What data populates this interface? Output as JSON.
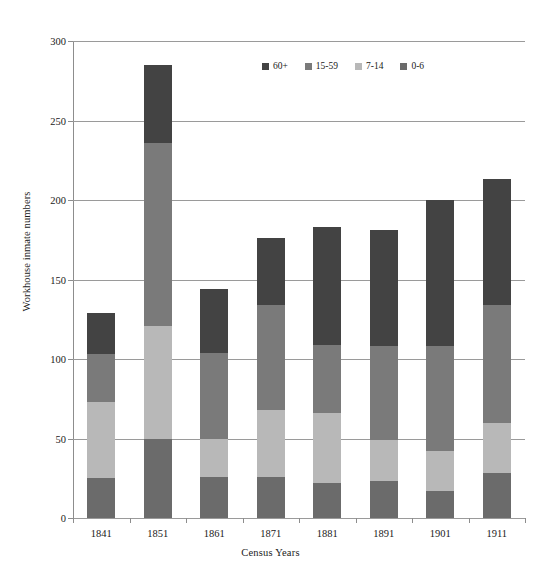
{
  "chart_data": {
    "type": "bar",
    "stacked": true,
    "title": "",
    "xlabel": "Census Years",
    "ylabel": "Workhouse inmate numbers",
    "categories": [
      "1841",
      "1851",
      "1861",
      "1871",
      "1881",
      "1891",
      "1901",
      "1911"
    ],
    "ylim": [
      0,
      300
    ],
    "yticks": [
      0,
      50,
      100,
      150,
      200,
      250,
      300
    ],
    "grid": true,
    "legend_position": "top-center",
    "series": [
      {
        "name": "0-6",
        "color": "#6b6b6b",
        "values": [
          25,
          50,
          26,
          26,
          22,
          23,
          17,
          28
        ]
      },
      {
        "name": "7-14",
        "color": "#b8b8b8",
        "values": [
          48,
          71,
          24,
          42,
          44,
          26,
          25,
          32
        ]
      },
      {
        "name": "15-59",
        "color": "#7a7a7a",
        "values": [
          30,
          115,
          54,
          66,
          43,
          59,
          66,
          74
        ]
      },
      {
        "name": "60+",
        "color": "#434343",
        "values": [
          26,
          49,
          40,
          42,
          74,
          73,
          92,
          79
        ]
      }
    ],
    "totals": [
      129,
      285,
      144,
      176,
      183,
      181,
      200,
      213
    ],
    "legend_order": [
      "60+",
      "15-59",
      "7-14",
      "0-6"
    ]
  },
  "axis": {
    "y_title": "Workhouse inmate numbers",
    "x_title": "Census Years",
    "y_tick_labels": [
      "0",
      "50",
      "100",
      "150",
      "200",
      "250",
      "300"
    ],
    "x_tick_labels": [
      "1841",
      "1851",
      "1861",
      "1871",
      "1881",
      "1891",
      "1901",
      "1911"
    ]
  },
  "legend": {
    "items": [
      {
        "label": "60+",
        "color": "#434343"
      },
      {
        "label": "15-59",
        "color": "#7a7a7a"
      },
      {
        "label": "7-14",
        "color": "#b8b8b8"
      },
      {
        "label": "0-6",
        "color": "#6b6b6b"
      }
    ]
  },
  "colors": {
    "grid": "#9a9a9a",
    "axis": "#8d8d8d",
    "text": "#1a1a1a",
    "background": "#ffffff"
  }
}
